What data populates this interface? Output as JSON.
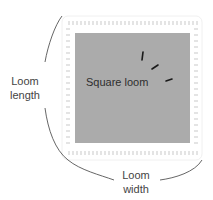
{
  "diagram": {
    "center_label": "Square loom",
    "length_label": "Loom length",
    "width_label": "Loom width",
    "colors": {
      "loom_fill": "#ababab",
      "board_fill": "#ffffff",
      "peg_color": "#e4e4e4",
      "brace_color": "#555555",
      "tick_color": "#1a1a1a",
      "text_color": "#444444"
    }
  }
}
